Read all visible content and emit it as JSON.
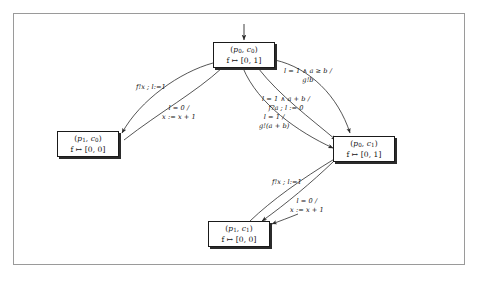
{
  "diagram": {
    "frame_color": "#9a9a9a",
    "node_border_color": "#1a1a1a",
    "shadow_color": "#2b2b2b",
    "edge_color": "#333333",
    "background": "#ffffff",
    "entry_arrow": "↓"
  },
  "nodes": [
    {
      "id": "p0c0",
      "state": "(p0, c0)",
      "state_p": "p",
      "state_p_sub": "0",
      "state_c": "c",
      "state_c_sub": "0",
      "mapping": "f ↦ [0, 1]",
      "x": 213,
      "y": 42,
      "w": 62,
      "h": 26
    },
    {
      "id": "p1c0",
      "state": "(p1, c0)",
      "state_p": "p",
      "state_p_sub": "1",
      "state_c": "c",
      "state_c_sub": "0",
      "mapping": "f ↦ [0, 0]",
      "x": 57,
      "y": 131,
      "w": 62,
      "h": 26
    },
    {
      "id": "p0c1",
      "state": "(p0, c1)",
      "state_p": "p",
      "state_p_sub": "0",
      "state_c": "c",
      "state_c_sub": "1",
      "mapping": "f ↦ [0, 1]",
      "x": 333,
      "y": 136,
      "w": 62,
      "h": 26
    },
    {
      "id": "p1c1",
      "state": "(p1, c1)",
      "state_p": "p",
      "state_p_sub": "1",
      "state_c": "c",
      "state_c_sub": "1",
      "mapping": "f ↦ [0, 0]",
      "x": 208,
      "y": 221,
      "w": 62,
      "h": 26
    }
  ],
  "edge_labels": [
    {
      "id": "upper-left-send",
      "line1": "f!x ; l:=1",
      "line2": "",
      "x": 136,
      "y": 83
    },
    {
      "id": "upper-left-guard",
      "line1": "l = 0 /",
      "line2": "x := x + 1",
      "x": 162,
      "y": 104
    },
    {
      "id": "upper-right-guard",
      "line1": "l = 1 ∧ a ≥ b /",
      "line2": "g!b",
      "x": 284,
      "y": 67
    },
    {
      "id": "middle-right-guard",
      "line1": "l = 1 ∧ a + b /",
      "line2": "f?a ; l := 0",
      "x": 262,
      "y": 95
    },
    {
      "id": "lower-middle-guard",
      "line1": "l = 1 /",
      "line2": "g!(a + b)",
      "x": 259,
      "y": 113
    },
    {
      "id": "lower-left-send",
      "line1": "f!x ; l:=1",
      "line2": "",
      "x": 272,
      "y": 178
    },
    {
      "id": "lower-right-guard",
      "line1": "l = 0 /",
      "line2": "x := x + 1",
      "x": 290,
      "y": 197
    }
  ]
}
